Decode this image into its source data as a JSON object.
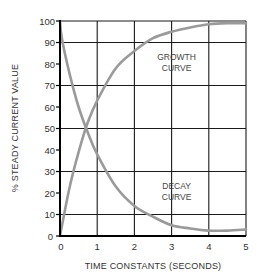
{
  "chart_data": {
    "type": "line",
    "title": "",
    "xlabel": "TIME CONSTANTS (SECONDS)",
    "ylabel": "% STEADY CURRENT VALUE",
    "xlim": [
      0,
      5
    ],
    "ylim": [
      0,
      100
    ],
    "x_ticks": [
      "0",
      "1",
      "2",
      "3",
      "4",
      "5"
    ],
    "y_ticks": [
      "0",
      "10",
      "20",
      "30",
      "40",
      "50",
      "60",
      "70",
      "80",
      "90",
      "100"
    ],
    "grid": true,
    "vertical_gridlines": [
      0,
      1,
      2,
      3,
      4,
      5
    ],
    "horizontal_gridlines": [
      0,
      10,
      30,
      50,
      70,
      90,
      100
    ],
    "legend": "none",
    "series": [
      {
        "name": "GROWTH CURVE",
        "x": [
          0,
          0.25,
          0.5,
          0.75,
          1,
          1.5,
          2,
          2.5,
          3,
          3.5,
          4,
          4.5,
          5
        ],
        "values": [
          0,
          22,
          39,
          53,
          63,
          78,
          86,
          92,
          95,
          97,
          98.5,
          99,
          99
        ]
      },
      {
        "name": "DECAY CURVE",
        "x": [
          0,
          0.05,
          0.25,
          0.5,
          0.75,
          1,
          1.5,
          2,
          2.5,
          3,
          3.5,
          4,
          4.5,
          5
        ],
        "values": [
          100,
          92,
          76,
          60,
          48,
          38,
          23,
          14,
          9,
          5,
          3.5,
          2.5,
          2.5,
          3
        ]
      }
    ],
    "annotations": [
      {
        "text": [
          "GROWTH",
          "CURVE"
        ],
        "x": 3.0,
        "y": 82
      },
      {
        "text": [
          "DECAY",
          "CURVE"
        ],
        "x": 3.0,
        "y": 22
      }
    ],
    "colors": {
      "curve": "#9a9a9a",
      "grid": "#1a1a1a",
      "text": "#333333"
    }
  }
}
